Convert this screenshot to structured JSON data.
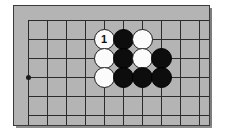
{
  "diagram": {
    "kind": "go-board-diagram",
    "board_color": "#b4b4b4",
    "line_color": "#2b2b2b",
    "frame_border_color": "#3a3a3a",
    "page_background": "#ffffff",
    "black_stone_color": "#0d0d0d",
    "white_stone_color": "#fbfbfb",
    "grid": {
      "columns": 10,
      "rows": 6,
      "origin_x": 14,
      "origin_y": 14,
      "spacing": 19,
      "vertical_line_length": 105,
      "horizontal_line_length": 190,
      "star_points": [
        {
          "col": 0,
          "row": 3
        }
      ]
    },
    "stones": [
      {
        "col": 4,
        "row": 1,
        "color": "white",
        "label": "1"
      },
      {
        "col": 5,
        "row": 1,
        "color": "black",
        "label": ""
      },
      {
        "col": 6,
        "row": 1,
        "color": "white",
        "label": ""
      },
      {
        "col": 4,
        "row": 2,
        "color": "white",
        "label": ""
      },
      {
        "col": 5,
        "row": 2,
        "color": "black",
        "label": ""
      },
      {
        "col": 6,
        "row": 2,
        "color": "white",
        "label": ""
      },
      {
        "col": 7,
        "row": 2,
        "color": "black",
        "label": ""
      },
      {
        "col": 4,
        "row": 3,
        "color": "white",
        "label": ""
      },
      {
        "col": 5,
        "row": 3,
        "color": "black",
        "label": ""
      },
      {
        "col": 6,
        "row": 3,
        "color": "black",
        "label": ""
      },
      {
        "col": 7,
        "row": 3,
        "color": "black",
        "label": ""
      }
    ]
  }
}
